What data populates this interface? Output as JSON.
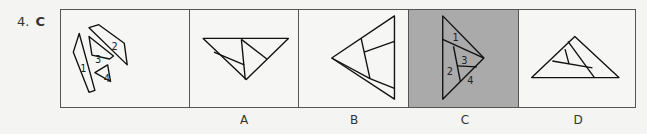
{
  "question": {
    "number": "4.",
    "answer": "C"
  },
  "panels": {
    "question": {
      "piece_labels": [
        "1",
        "2",
        "3",
        "4"
      ]
    },
    "options": [
      {
        "label": "A",
        "selected": false
      },
      {
        "label": "B",
        "selected": false
      },
      {
        "label": "C",
        "selected": true,
        "piece_labels": [
          "1",
          "2",
          "3",
          "4"
        ]
      },
      {
        "label": "D",
        "selected": false
      }
    ]
  },
  "colors": {
    "border": "#555555",
    "background": "#f6f6f4",
    "selected_fill": "#aaaaaa",
    "stroke": "#111111"
  }
}
